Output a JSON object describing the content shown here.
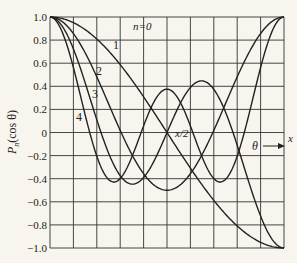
{
  "chart_data": {
    "type": "line",
    "title": "",
    "xlabel": "θ",
    "x_axis_end_label": "x",
    "ylabel": "P_n(cos θ)",
    "ylabel_main": "P",
    "ylabel_sub": "n",
    "ylabel_arg": "(cos θ)",
    "ylim": [
      -1.0,
      1.0
    ],
    "xlim": [
      0,
      3.14159
    ],
    "grid": true,
    "y_ticks": [
      "1.0",
      "0.8",
      "0.6",
      "0.4",
      "0.2",
      "0",
      "−0.2",
      "−0.4",
      "−0.6",
      "−0.8",
      "−1.0"
    ],
    "y_tick_values": [
      1.0,
      0.8,
      0.6,
      0.4,
      0.2,
      0,
      -0.2,
      -0.4,
      -0.6,
      -0.8,
      -1.0
    ],
    "x_grid_divisions": 10,
    "annotations": {
      "n_label": "n=0",
      "mid_label": "x/2",
      "theta_arrow": "θ",
      "note": "x/2 and x are likely a garbled π/2 and π; transcribed as shown"
    },
    "series": [
      {
        "name": "1",
        "label": "1",
        "formula": "P1(cosθ)",
        "x": [
          0,
          0.314,
          0.628,
          0.942,
          1.257,
          1.571,
          1.885,
          2.199,
          2.513,
          2.827,
          3.142
        ],
        "values": [
          1.0,
          0.951,
          0.809,
          0.588,
          0.309,
          0.0,
          -0.309,
          -0.588,
          -0.809,
          -0.951,
          -1.0
        ]
      },
      {
        "name": "2",
        "label": "2",
        "formula": "P2(cosθ)",
        "x": [
          0,
          0.314,
          0.628,
          0.942,
          1.257,
          1.571,
          1.885,
          2.199,
          2.513,
          2.827,
          3.142
        ],
        "values": [
          1.0,
          0.857,
          0.482,
          0.019,
          -0.357,
          -0.5,
          -0.357,
          0.019,
          0.482,
          0.857,
          1.0
        ]
      },
      {
        "name": "3",
        "label": "3",
        "formula": "P3(cosθ)",
        "x": [
          0,
          0.314,
          0.628,
          0.942,
          1.257,
          1.571,
          1.885,
          2.199,
          2.513,
          2.827,
          3.142
        ],
        "values": [
          1.0,
          0.724,
          0.111,
          -0.372,
          -0.406,
          0.0,
          0.406,
          0.372,
          -0.111,
          -0.724,
          -1.0
        ]
      },
      {
        "name": "4",
        "label": "4",
        "formula": "P4(cosθ)",
        "x": [
          0,
          0.314,
          0.628,
          0.942,
          1.257,
          1.571,
          1.885,
          2.199,
          2.513,
          2.827,
          3.142
        ],
        "values": [
          1.0,
          0.552,
          -0.243,
          -0.406,
          0.111,
          0.375,
          0.111,
          -0.406,
          -0.243,
          0.552,
          1.0
        ]
      }
    ]
  },
  "plot": {
    "left": 50,
    "right": 284,
    "top": 17,
    "bottom": 248,
    "line_color": "#222222",
    "grid_color": "#333333",
    "background": "#f7f5ee"
  },
  "labels": {
    "curve_1": {
      "text": "1",
      "x": 113,
      "y": 49
    },
    "curve_2": {
      "text": "2",
      "x": 96,
      "y": 75
    },
    "curve_3": {
      "text": "3",
      "x": 92,
      "y": 98
    },
    "curve_4": {
      "text": "4",
      "x": 76,
      "y": 121
    },
    "n0": {
      "text": "n=0",
      "x": 135,
      "y": 30
    }
  }
}
